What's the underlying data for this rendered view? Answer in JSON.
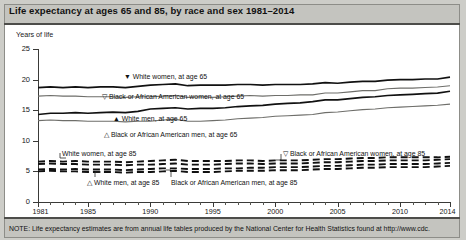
{
  "title": "Life expectancy at ages 65 and 85, by race and sex 1981–2014",
  "ylabel": "Years of life",
  "footnote": "NOTE: Life expectancy estimates are from annual life tables produced by the National Center for Health Statistics found at http://www.cdc.",
  "annotations": {
    "white_women_65": "▼ White women, at age 65",
    "black_women_65": "▽ Black or African American women, at age 65",
    "white_men_65": "▲ White men, at age 65",
    "black_men_65": "△ Black or African American men, at age 65",
    "white_women_85": "White women, at age 85",
    "white_men_85": "△ White men, at age 85",
    "black_women_85": "▽ Black or African American women, at age 85",
    "black_men_85": "Black or African American men, at age 85"
  },
  "chart_data": {
    "type": "line",
    "title": "Life expectancy at ages 65 and 85, by race and sex 1981–2014",
    "xlabel": "",
    "ylabel": "Years of life",
    "xlim": [
      1981,
      2014
    ],
    "ylim": [
      0,
      25
    ],
    "yticks": [
      0,
      5,
      10,
      15,
      20,
      25
    ],
    "xticks": [
      1981,
      1985,
      1990,
      1995,
      2000,
      2005,
      2010,
      2014
    ],
    "xtick_labels": [
      "1981",
      "1985",
      "1990",
      "1995",
      "2000",
      "2005",
      "2010",
      "2014"
    ],
    "grid": false,
    "legend": "inline-annotations",
    "x": [
      1981,
      1982,
      1983,
      1984,
      1985,
      1986,
      1987,
      1988,
      1989,
      1990,
      1991,
      1992,
      1993,
      1994,
      1995,
      1996,
      1997,
      1998,
      1999,
      2000,
      2001,
      2002,
      2003,
      2004,
      2005,
      2006,
      2007,
      2008,
      2009,
      2010,
      2011,
      2012,
      2013,
      2014
    ],
    "series": [
      {
        "name": "White women, at age 65",
        "marker": "filled-down-triangle",
        "style": "solid",
        "values": [
          18.7,
          18.8,
          18.7,
          18.8,
          18.7,
          18.8,
          18.8,
          18.7,
          18.9,
          19.1,
          19.2,
          19.3,
          19.0,
          19.1,
          19.1,
          19.1,
          19.2,
          19.2,
          19.1,
          19.2,
          19.2,
          19.2,
          19.3,
          19.5,
          19.4,
          19.6,
          19.7,
          19.7,
          19.9,
          20.0,
          20.0,
          20.1,
          20.1,
          20.4
        ]
      },
      {
        "name": "Black or African American women, at age 65",
        "marker": "open-down-triangle",
        "style": "solid",
        "values": [
          17.3,
          17.4,
          17.3,
          17.3,
          17.2,
          17.2,
          17.2,
          17.1,
          17.2,
          17.2,
          17.3,
          17.4,
          17.1,
          17.2,
          17.1,
          17.2,
          17.3,
          17.4,
          17.3,
          17.4,
          17.4,
          17.5,
          17.5,
          17.8,
          17.8,
          18.0,
          18.2,
          18.2,
          18.5,
          18.6,
          18.6,
          18.7,
          18.8,
          19.0
        ]
      },
      {
        "name": "White men, at age 65",
        "marker": "filled-up-triangle",
        "style": "solid",
        "values": [
          14.3,
          14.5,
          14.5,
          14.6,
          14.5,
          14.6,
          14.7,
          14.6,
          14.8,
          15.2,
          15.3,
          15.4,
          15.2,
          15.3,
          15.3,
          15.4,
          15.6,
          15.7,
          15.8,
          16.0,
          16.1,
          16.2,
          16.4,
          16.7,
          16.7,
          16.9,
          17.1,
          17.2,
          17.4,
          17.5,
          17.6,
          17.7,
          17.8,
          18.1
        ]
      },
      {
        "name": "Black or African American men, at age 65",
        "marker": "open-up-triangle",
        "style": "solid",
        "values": [
          13.3,
          13.4,
          13.3,
          13.3,
          13.2,
          13.2,
          13.2,
          13.1,
          13.2,
          13.2,
          13.4,
          13.5,
          13.2,
          13.2,
          13.3,
          13.4,
          13.6,
          13.7,
          13.8,
          14.0,
          14.1,
          14.2,
          14.3,
          14.6,
          14.7,
          14.9,
          15.1,
          15.2,
          15.4,
          15.5,
          15.6,
          15.7,
          15.8,
          16.0
        ]
      },
      {
        "name": "White women, at age 85",
        "marker": "none",
        "style": "dashed",
        "values": [
          6.6,
          6.7,
          6.6,
          6.7,
          6.6,
          6.6,
          6.6,
          6.5,
          6.6,
          6.7,
          6.8,
          6.9,
          6.7,
          6.7,
          6.7,
          6.7,
          6.8,
          6.8,
          6.7,
          6.8,
          6.8,
          6.8,
          6.9,
          7.0,
          7.0,
          7.1,
          7.2,
          7.2,
          7.3,
          7.3,
          7.3,
          7.3,
          7.3,
          7.4
        ]
      },
      {
        "name": "Black or African American women, at age 85",
        "marker": "open-down-triangle",
        "style": "dashed",
        "values": [
          6.2,
          6.3,
          6.2,
          6.2,
          6.1,
          6.1,
          6.1,
          6.0,
          6.1,
          6.1,
          6.2,
          6.3,
          6.1,
          6.1,
          6.1,
          6.2,
          6.3,
          6.3,
          6.2,
          6.3,
          6.3,
          6.3,
          6.4,
          6.5,
          6.5,
          6.6,
          6.7,
          6.7,
          6.8,
          6.8,
          6.8,
          6.8,
          6.9,
          7.0
        ]
      },
      {
        "name": "White men, at age 85",
        "marker": "open-up-triangle",
        "style": "dashed",
        "values": [
          5.3,
          5.4,
          5.3,
          5.4,
          5.3,
          5.3,
          5.3,
          5.2,
          5.3,
          5.4,
          5.5,
          5.5,
          5.4,
          5.4,
          5.4,
          5.5,
          5.5,
          5.6,
          5.6,
          5.7,
          5.7,
          5.7,
          5.8,
          5.9,
          5.9,
          6.0,
          6.1,
          6.1,
          6.2,
          6.2,
          6.2,
          6.2,
          6.3,
          6.4
        ]
      },
      {
        "name": "Black or African American men, at age 85",
        "marker": "none",
        "style": "dashed",
        "values": [
          5.0,
          5.1,
          5.0,
          5.0,
          4.9,
          4.9,
          4.9,
          4.8,
          4.9,
          4.9,
          5.0,
          5.1,
          4.9,
          4.9,
          4.9,
          5.0,
          5.1,
          5.1,
          5.1,
          5.2,
          5.2,
          5.2,
          5.3,
          5.4,
          5.4,
          5.5,
          5.6,
          5.6,
          5.7,
          5.7,
          5.7,
          5.7,
          5.8,
          5.9
        ]
      }
    ]
  }
}
